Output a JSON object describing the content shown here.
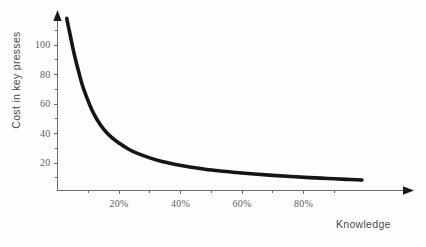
{
  "chart_data": {
    "type": "line",
    "title": "",
    "subtitle": "",
    "xlabel": "Knowledge",
    "ylabel": "Cost in key presses",
    "xlim": [
      0,
      100
    ],
    "ylim": [
      0,
      118
    ],
    "grid": false,
    "legend": null,
    "x_tick_labels": [
      "20%",
      "40%",
      "60%",
      "80%"
    ],
    "x_tick_values": [
      20,
      40,
      60,
      80
    ],
    "x_minor_ticks": [
      10,
      30,
      50,
      70,
      90
    ],
    "y_tick_labels": [
      "20",
      "40",
      "60",
      "80",
      "100"
    ],
    "y_tick_values": [
      20,
      40,
      60,
      80,
      100
    ],
    "y_minor_ticks": [
      10,
      30,
      50,
      70,
      90,
      110
    ],
    "series": [
      {
        "name": "cost",
        "x": [
          3.0,
          3.4,
          3.9,
          4.5,
          5.2,
          6.0,
          7.0,
          8.2,
          9.6,
          11.2,
          13.0,
          15.0,
          17.5,
          20.0,
          23.0,
          26.0,
          30.0,
          34.0,
          38.0,
          43.0,
          48.0,
          53.0,
          58.0,
          64.0,
          70.0,
          76.0,
          82.0,
          88.0,
          94.0,
          99.0
        ],
        "y": [
          118.0,
          114.0,
          109.0,
          103.0,
          96.0,
          89.0,
          81.0,
          72.0,
          64.0,
          56.0,
          49.0,
          43.0,
          37.5,
          33.5,
          29.5,
          26.5,
          23.5,
          21.0,
          19.2,
          17.3,
          15.8,
          14.6,
          13.6,
          12.5,
          11.6,
          10.8,
          10.1,
          9.5,
          8.9,
          8.5
        ]
      }
    ],
    "curve_color": "#151515",
    "axis_color": "#6b6b6b",
    "background_color": "#fefefe",
    "annotations": []
  },
  "axes": {
    "y_axis_name": "y-axis",
    "x_axis_name": "x-axis",
    "arrow_top": "arrow-up",
    "arrow_right": "arrow-right"
  }
}
